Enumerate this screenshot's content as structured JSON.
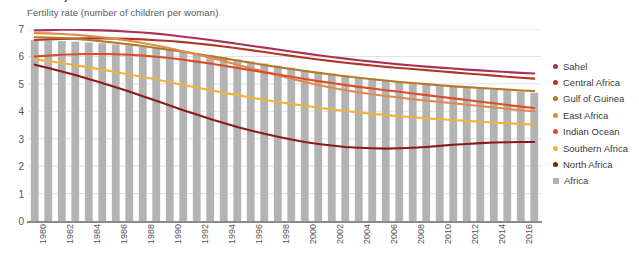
{
  "figure": {
    "title": "Fertility rate in Africa",
    "subtitle": "Fertility rate (number of children per woman)"
  },
  "legend": {
    "position": "right",
    "items": [
      {
        "label": "Sahel",
        "color": "#a83156",
        "marker": "dot"
      },
      {
        "label": "Central Africa",
        "color": "#b03724",
        "marker": "dot"
      },
      {
        "label": "Gulf of Guinea",
        "color": "#b07a2a",
        "marker": "dot"
      },
      {
        "label": "East Africa",
        "color": "#e08a4a",
        "marker": "dot"
      },
      {
        "label": "Indian Ocean",
        "color": "#dd4b27",
        "marker": "dot"
      },
      {
        "label": "Southern Africa",
        "color": "#f2b23c",
        "marker": "dot"
      },
      {
        "label": "North Africa",
        "color": "#8c1b16",
        "marker": "dot"
      },
      {
        "label": "Africa",
        "color": "#b3b3b3",
        "marker": "square"
      }
    ]
  },
  "axes": {
    "ylabel": "",
    "xlabel": "",
    "ylim": [
      0,
      7
    ],
    "yticks": [
      "0",
      "1",
      "2",
      "3",
      "4",
      "5",
      "6",
      "7"
    ],
    "xticks": [
      "1980",
      "1982",
      "1984",
      "1986",
      "1988",
      "1990",
      "1992",
      "1994",
      "1996",
      "1998",
      "2000",
      "2002",
      "2004",
      "2006",
      "2008",
      "2010",
      "2012",
      "2014",
      "2016"
    ],
    "grid": "horizontal"
  },
  "chart_data": {
    "type": "line",
    "title": "Fertility rate in Africa",
    "subtitle": "Fertility rate (number of children per woman)",
    "xlabel": "",
    "ylabel": "Fertility rate (number of children per woman)",
    "ylim": [
      0,
      7
    ],
    "grid": true,
    "legend_position": "right",
    "x": [
      1980,
      1981,
      1982,
      1983,
      1984,
      1985,
      1986,
      1987,
      1988,
      1989,
      1990,
      1991,
      1992,
      1993,
      1994,
      1995,
      1996,
      1997,
      1998,
      1999,
      2000,
      2001,
      2002,
      2003,
      2004,
      2005,
      2006,
      2007,
      2008,
      2009,
      2010,
      2011,
      2012,
      2013,
      2014,
      2015,
      2016,
      2017
    ],
    "series": [
      {
        "name": "Sahel",
        "color": "#a83156",
        "type": "line",
        "values": [
          6.95,
          6.96,
          6.97,
          6.97,
          6.96,
          6.95,
          6.93,
          6.9,
          6.87,
          6.83,
          6.78,
          6.72,
          6.66,
          6.6,
          6.53,
          6.46,
          6.39,
          6.32,
          6.25,
          6.18,
          6.11,
          6.04,
          5.98,
          5.92,
          5.86,
          5.81,
          5.76,
          5.71,
          5.67,
          5.63,
          5.59,
          5.56,
          5.52,
          5.49,
          5.46,
          5.43,
          5.4,
          5.38
        ]
      },
      {
        "name": "Central Africa",
        "color": "#b03724",
        "type": "line",
        "values": [
          6.6,
          6.62,
          6.64,
          6.65,
          6.66,
          6.66,
          6.65,
          6.64,
          6.62,
          6.59,
          6.56,
          6.52,
          6.47,
          6.42,
          6.36,
          6.3,
          6.23,
          6.16,
          6.09,
          6.02,
          5.95,
          5.89,
          5.83,
          5.77,
          5.72,
          5.67,
          5.62,
          5.58,
          5.54,
          5.5,
          5.46,
          5.42,
          5.38,
          5.34,
          5.3,
          5.26,
          5.22,
          5.19
        ]
      },
      {
        "name": "Gulf of Guinea",
        "color": "#b07a2a",
        "type": "line",
        "values": [
          6.7,
          6.69,
          6.67,
          6.64,
          6.6,
          6.55,
          6.5,
          6.44,
          6.38,
          6.31,
          6.24,
          6.17,
          6.09,
          6.01,
          5.93,
          5.85,
          5.77,
          5.69,
          5.61,
          5.54,
          5.47,
          5.4,
          5.34,
          5.28,
          5.22,
          5.17,
          5.12,
          5.07,
          5.03,
          4.99,
          4.95,
          4.91,
          4.88,
          4.85,
          4.82,
          4.79,
          4.76,
          4.74
        ]
      },
      {
        "name": "East Africa",
        "color": "#e08a4a",
        "type": "line",
        "values": [
          6.85,
          6.84,
          6.82,
          6.79,
          6.75,
          6.7,
          6.64,
          6.57,
          6.49,
          6.4,
          6.3,
          6.19,
          6.07,
          5.95,
          5.83,
          5.7,
          5.57,
          5.44,
          5.31,
          5.19,
          5.07,
          4.96,
          4.86,
          4.77,
          4.69,
          4.62,
          4.56,
          4.5,
          4.44,
          4.39,
          4.34,
          4.29,
          4.24,
          4.19,
          4.14,
          4.09,
          4.04,
          4.0
        ]
      },
      {
        "name": "Indian Ocean",
        "color": "#dd4b27",
        "type": "line",
        "values": [
          6.0,
          6.03,
          6.06,
          6.08,
          6.09,
          6.09,
          6.08,
          6.06,
          6.03,
          5.99,
          5.94,
          5.88,
          5.81,
          5.74,
          5.66,
          5.58,
          5.5,
          5.42,
          5.34,
          5.26,
          5.18,
          5.1,
          5.03,
          4.96,
          4.89,
          4.83,
          4.77,
          4.71,
          4.65,
          4.59,
          4.53,
          4.47,
          4.41,
          4.35,
          4.29,
          4.23,
          4.17,
          4.12
        ]
      },
      {
        "name": "Southern Africa",
        "color": "#f2b23c",
        "type": "line",
        "values": [
          5.9,
          5.83,
          5.76,
          5.68,
          5.6,
          5.52,
          5.43,
          5.34,
          5.25,
          5.16,
          5.06,
          4.96,
          4.87,
          4.77,
          4.68,
          4.59,
          4.5,
          4.42,
          4.34,
          4.27,
          4.2,
          4.13,
          4.07,
          4.01,
          3.96,
          3.91,
          3.86,
          3.82,
          3.78,
          3.74,
          3.71,
          3.68,
          3.65,
          3.62,
          3.59,
          3.56,
          3.54,
          3.52
        ]
      },
      {
        "name": "North Africa",
        "color": "#8c1b16",
        "type": "line",
        "values": [
          5.7,
          5.58,
          5.45,
          5.32,
          5.18,
          5.03,
          4.88,
          4.72,
          4.55,
          4.38,
          4.21,
          4.04,
          3.88,
          3.72,
          3.57,
          3.43,
          3.3,
          3.18,
          3.07,
          2.97,
          2.88,
          2.81,
          2.75,
          2.7,
          2.67,
          2.65,
          2.64,
          2.65,
          2.67,
          2.7,
          2.74,
          2.78,
          2.81,
          2.84,
          2.86,
          2.87,
          2.88,
          2.88
        ]
      },
      {
        "name": "Africa",
        "color": "#b3b3b3",
        "type": "bar",
        "values": [
          6.6,
          6.58,
          6.56,
          6.54,
          6.51,
          6.48,
          6.44,
          6.4,
          6.35,
          6.3,
          6.24,
          6.18,
          6.11,
          6.04,
          5.97,
          5.89,
          5.82,
          5.74,
          5.66,
          5.59,
          5.51,
          5.44,
          5.37,
          5.31,
          5.25,
          5.19,
          5.14,
          5.09,
          5.04,
          5.0,
          4.95,
          4.91,
          4.87,
          4.83,
          4.79,
          4.75,
          4.71,
          4.68
        ]
      }
    ]
  }
}
